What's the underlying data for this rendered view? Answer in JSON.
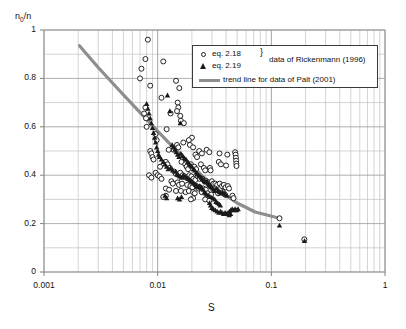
{
  "chart_data": {
    "type": "scatter",
    "title": "",
    "xlabel": "S",
    "ylabel": "n0/n",
    "ylabel_base": "n",
    "ylabel_sub": "0",
    "ylabel_tail": "/n",
    "xscale": "log",
    "yscale": "linear",
    "xlim": [
      0.001,
      1
    ],
    "ylim": [
      0,
      1
    ],
    "grid": true,
    "gridlines_minor_x": true,
    "x_ticks": [
      0.001,
      0.01,
      0.1,
      1
    ],
    "x_tick_labels": [
      "0.001",
      "0.01",
      "0.1",
      "1"
    ],
    "y_ticks": [
      0,
      0.2,
      0.4,
      0.6,
      0.8,
      1
    ],
    "y_tick_labels": [
      "0",
      "0.2",
      "0.4",
      "0.6",
      "0.8",
      "1"
    ],
    "y_minor_ticks": [
      0.1,
      0.3,
      0.5,
      0.7,
      0.9
    ],
    "legend_position": "top-right-inside",
    "legend": [
      {
        "marker": "open-circle",
        "label": "eq. 2.18"
      },
      {
        "marker": "filled-triangle",
        "label": "eq. 2.19"
      },
      {
        "marker": "line",
        "label": "trend line for data of Palt (2001)"
      }
    ],
    "legend_group_label": "data of Rickenmann (1996)",
    "legend_group_brace": "}",
    "colors": {
      "marker_stroke": "#222222",
      "triangle_fill": "#1b1b1b",
      "trend_line": "#8e8e8e",
      "grid_major": "#9a9a9a",
      "grid_minor": "#c2c2c2",
      "axis": "#808080",
      "background": "#ffffff"
    },
    "series": [
      {
        "name": "eq. 2.18",
        "marker": "open-circle",
        "points": [
          [
            0.0082,
            0.96
          ],
          [
            0.0078,
            0.88
          ],
          [
            0.0072,
            0.84
          ],
          [
            0.007,
            0.8
          ],
          [
            0.0112,
            0.87
          ],
          [
            0.0086,
            0.77
          ],
          [
            0.0145,
            0.79
          ],
          [
            0.0155,
            0.76
          ],
          [
            0.0108,
            0.72
          ],
          [
            0.015,
            0.7
          ],
          [
            0.0152,
            0.68
          ],
          [
            0.0148,
            0.665
          ],
          [
            0.0078,
            0.68
          ],
          [
            0.0076,
            0.655
          ],
          [
            0.013,
            0.655
          ],
          [
            0.0158,
            0.645
          ],
          [
            0.016,
            0.625
          ],
          [
            0.0079,
            0.635
          ],
          [
            0.008,
            0.6
          ],
          [
            0.017,
            0.615
          ],
          [
            0.012,
            0.59
          ],
          [
            0.0096,
            0.57
          ],
          [
            0.0098,
            0.545
          ],
          [
            0.02,
            0.555
          ],
          [
            0.0188,
            0.545
          ],
          [
            0.0168,
            0.535
          ],
          [
            0.0192,
            0.525
          ],
          [
            0.0205,
            0.515
          ],
          [
            0.0148,
            0.525
          ],
          [
            0.0152,
            0.515
          ],
          [
            0.0138,
            0.505
          ],
          [
            0.0125,
            0.505
          ],
          [
            0.0086,
            0.5
          ],
          [
            0.0088,
            0.49
          ],
          [
            0.009,
            0.475
          ],
          [
            0.0092,
            0.465
          ],
          [
            0.027,
            0.505
          ],
          [
            0.0285,
            0.495
          ],
          [
            0.0232,
            0.5
          ],
          [
            0.0245,
            0.49
          ],
          [
            0.0215,
            0.485
          ],
          [
            0.0222,
            0.475
          ],
          [
            0.035,
            0.49
          ],
          [
            0.041,
            0.485
          ],
          [
            0.048,
            0.495
          ],
          [
            0.0485,
            0.485
          ],
          [
            0.0488,
            0.472
          ],
          [
            0.049,
            0.46
          ],
          [
            0.0492,
            0.448
          ],
          [
            0.0494,
            0.438
          ],
          [
            0.0345,
            0.455
          ],
          [
            0.036,
            0.445
          ],
          [
            0.04,
            0.44
          ],
          [
            0.0118,
            0.455
          ],
          [
            0.0122,
            0.445
          ],
          [
            0.0105,
            0.435
          ],
          [
            0.0128,
            0.43
          ],
          [
            0.0162,
            0.455
          ],
          [
            0.0175,
            0.445
          ],
          [
            0.018,
            0.435
          ],
          [
            0.0185,
            0.425
          ],
          [
            0.0196,
            0.445
          ],
          [
            0.021,
            0.435
          ],
          [
            0.0218,
            0.425
          ],
          [
            0.024,
            0.445
          ],
          [
            0.0255,
            0.43
          ],
          [
            0.0262,
            0.42
          ],
          [
            0.0288,
            0.43
          ],
          [
            0.0292,
            0.42
          ],
          [
            0.014,
            0.415
          ],
          [
            0.0145,
            0.405
          ],
          [
            0.0158,
            0.41
          ],
          [
            0.0166,
            0.4
          ],
          [
            0.0172,
            0.395
          ],
          [
            0.0178,
            0.39
          ],
          [
            0.019,
            0.4
          ],
          [
            0.0198,
            0.395
          ],
          [
            0.0206,
            0.385
          ],
          [
            0.0214,
            0.38
          ],
          [
            0.0226,
            0.395
          ],
          [
            0.0234,
            0.385
          ],
          [
            0.0248,
            0.385
          ],
          [
            0.0258,
            0.375
          ],
          [
            0.0096,
            0.41
          ],
          [
            0.01,
            0.4
          ],
          [
            0.0104,
            0.395
          ],
          [
            0.0108,
            0.385
          ],
          [
            0.0084,
            0.4
          ],
          [
            0.0088,
            0.39
          ],
          [
            0.0268,
            0.375
          ],
          [
            0.0278,
            0.37
          ],
          [
            0.03,
            0.375
          ],
          [
            0.031,
            0.365
          ],
          [
            0.0322,
            0.365
          ],
          [
            0.0334,
            0.36
          ],
          [
            0.0352,
            0.365
          ],
          [
            0.0368,
            0.355
          ],
          [
            0.0382,
            0.36
          ],
          [
            0.0396,
            0.35
          ],
          [
            0.0415,
            0.355
          ],
          [
            0.0425,
            0.345
          ],
          [
            0.0132,
            0.375
          ],
          [
            0.0136,
            0.365
          ],
          [
            0.015,
            0.37
          ],
          [
            0.0154,
            0.36
          ],
          [
            0.0164,
            0.365
          ],
          [
            0.0182,
            0.36
          ],
          [
            0.0194,
            0.355
          ],
          [
            0.0202,
            0.35
          ],
          [
            0.022,
            0.355
          ],
          [
            0.0228,
            0.345
          ],
          [
            0.0236,
            0.35
          ],
          [
            0.0252,
            0.345
          ],
          [
            0.0265,
            0.34
          ],
          [
            0.0118,
            0.345
          ],
          [
            0.0126,
            0.34
          ],
          [
            0.0145,
            0.335
          ],
          [
            0.016,
            0.335
          ],
          [
            0.0176,
            0.33
          ],
          [
            0.0188,
            0.335
          ],
          [
            0.0205,
            0.33
          ],
          [
            0.0212,
            0.325
          ],
          [
            0.0244,
            0.33
          ],
          [
            0.0275,
            0.325
          ],
          [
            0.0295,
            0.32
          ],
          [
            0.033,
            0.335
          ],
          [
            0.034,
            0.325
          ],
          [
            0.0375,
            0.33
          ],
          [
            0.039,
            0.32
          ],
          [
            0.0118,
            0.315
          ],
          [
            0.0112,
            0.31
          ],
          [
            0.118,
            0.222
          ],
          [
            0.195,
            0.135
          ],
          [
            0.0455,
            0.315
          ],
          [
            0.0465,
            0.305
          ],
          [
            0.0262,
            0.3
          ],
          [
            0.0285,
            0.295
          ],
          [
            0.0205,
            0.305
          ],
          [
            0.0196,
            0.3
          ]
        ]
      },
      {
        "name": "eq. 2.19",
        "marker": "filled-triangle",
        "points": [
          [
            0.008,
            0.695
          ],
          [
            0.0082,
            0.675
          ],
          [
            0.0084,
            0.655
          ],
          [
            0.0086,
            0.635
          ],
          [
            0.0122,
            0.73
          ],
          [
            0.0128,
            0.665
          ],
          [
            0.0088,
            0.615
          ],
          [
            0.009,
            0.595
          ],
          [
            0.0092,
            0.575
          ],
          [
            0.0094,
            0.555
          ],
          [
            0.0158,
            0.615
          ],
          [
            0.0096,
            0.535
          ],
          [
            0.0098,
            0.515
          ],
          [
            0.01,
            0.5
          ],
          [
            0.0102,
            0.485
          ],
          [
            0.0104,
            0.475
          ],
          [
            0.0134,
            0.525
          ],
          [
            0.0138,
            0.515
          ],
          [
            0.0142,
            0.505
          ],
          [
            0.0146,
            0.495
          ],
          [
            0.015,
            0.485
          ],
          [
            0.0154,
            0.475
          ],
          [
            0.016,
            0.49
          ],
          [
            0.0166,
            0.48
          ],
          [
            0.0172,
            0.47
          ],
          [
            0.0178,
            0.465
          ],
          [
            0.0184,
            0.455
          ],
          [
            0.019,
            0.445
          ],
          [
            0.0196,
            0.44
          ],
          [
            0.0108,
            0.465
          ],
          [
            0.0112,
            0.455
          ],
          [
            0.0116,
            0.445
          ],
          [
            0.012,
            0.435
          ],
          [
            0.0124,
            0.425
          ],
          [
            0.013,
            0.43
          ],
          [
            0.0136,
            0.42
          ],
          [
            0.02,
            0.435
          ],
          [
            0.0206,
            0.425
          ],
          [
            0.0212,
            0.42
          ],
          [
            0.0218,
            0.41
          ],
          [
            0.0224,
            0.405
          ],
          [
            0.023,
            0.4
          ],
          [
            0.0144,
            0.415
          ],
          [
            0.0148,
            0.405
          ],
          [
            0.0152,
            0.4
          ],
          [
            0.0156,
            0.395
          ],
          [
            0.0162,
            0.39
          ],
          [
            0.0168,
            0.4
          ],
          [
            0.0174,
            0.395
          ],
          [
            0.018,
            0.39
          ],
          [
            0.0186,
            0.385
          ],
          [
            0.0192,
            0.38
          ],
          [
            0.0236,
            0.395
          ],
          [
            0.0242,
            0.39
          ],
          [
            0.0248,
            0.385
          ],
          [
            0.0254,
            0.38
          ],
          [
            0.026,
            0.375
          ],
          [
            0.0266,
            0.37
          ],
          [
            0.0272,
            0.375
          ],
          [
            0.0278,
            0.365
          ],
          [
            0.0284,
            0.36
          ],
          [
            0.029,
            0.355
          ],
          [
            0.0198,
            0.375
          ],
          [
            0.0204,
            0.37
          ],
          [
            0.021,
            0.365
          ],
          [
            0.0216,
            0.36
          ],
          [
            0.0222,
            0.355
          ],
          [
            0.0228,
            0.35
          ],
          [
            0.0234,
            0.355
          ],
          [
            0.024,
            0.35
          ],
          [
            0.0246,
            0.345
          ],
          [
            0.0252,
            0.34
          ],
          [
            0.0296,
            0.35
          ],
          [
            0.0304,
            0.345
          ],
          [
            0.0312,
            0.34
          ],
          [
            0.032,
            0.335
          ],
          [
            0.033,
            0.345
          ],
          [
            0.034,
            0.335
          ],
          [
            0.035,
            0.33
          ],
          [
            0.036,
            0.325
          ],
          [
            0.0372,
            0.33
          ],
          [
            0.0384,
            0.325
          ],
          [
            0.0396,
            0.32
          ],
          [
            0.0408,
            0.315
          ],
          [
            0.0258,
            0.33
          ],
          [
            0.0264,
            0.325
          ],
          [
            0.027,
            0.32
          ],
          [
            0.0282,
            0.315
          ],
          [
            0.0294,
            0.31
          ],
          [
            0.0306,
            0.305
          ],
          [
            0.0318,
            0.3
          ],
          [
            0.0116,
            0.315
          ],
          [
            0.012,
            0.305
          ],
          [
            0.015,
            0.305
          ],
          [
            0.0156,
            0.3
          ],
          [
            0.0162,
            0.31
          ],
          [
            0.0326,
            0.29
          ],
          [
            0.0338,
            0.285
          ],
          [
            0.0348,
            0.28
          ],
          [
            0.0356,
            0.275
          ],
          [
            0.0286,
            0.285
          ],
          [
            0.0292,
            0.275
          ],
          [
            0.03,
            0.265
          ],
          [
            0.031,
            0.26
          ],
          [
            0.0322,
            0.255
          ],
          [
            0.0334,
            0.25
          ],
          [
            0.0346,
            0.245
          ],
          [
            0.0358,
            0.25
          ],
          [
            0.0368,
            0.245
          ],
          [
            0.038,
            0.24
          ],
          [
            0.0392,
            0.245
          ],
          [
            0.0404,
            0.24
          ],
          [
            0.0416,
            0.245
          ],
          [
            0.0428,
            0.25
          ],
          [
            0.044,
            0.255
          ],
          [
            0.0452,
            0.26
          ],
          [
            0.0466,
            0.255
          ],
          [
            0.048,
            0.26
          ],
          [
            0.0495,
            0.255
          ],
          [
            0.051,
            0.26
          ],
          [
            0.118,
            0.192
          ],
          [
            0.196,
            0.128
          ],
          [
            0.0426,
            0.235
          ],
          [
            0.0438,
            0.24
          ]
        ]
      }
    ],
    "trend_line": {
      "name": "trend line for data of Palt (2001)",
      "points": [
        [
          0.00205,
          0.935
        ],
        [
          0.003,
          0.845
        ],
        [
          0.0045,
          0.755
        ],
        [
          0.0065,
          0.675
        ],
        [
          0.009,
          0.605
        ],
        [
          0.0125,
          0.535
        ],
        [
          0.0175,
          0.465
        ],
        [
          0.025,
          0.395
        ],
        [
          0.035,
          0.335
        ],
        [
          0.05,
          0.285
        ],
        [
          0.072,
          0.248
        ],
        [
          0.118,
          0.222
        ]
      ]
    }
  }
}
